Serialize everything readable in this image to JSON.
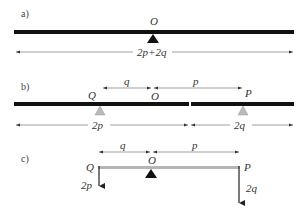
{
  "panels": {
    "a": {
      "label": "a)",
      "pivot_label": "O",
      "length_label": "2p+2q"
    },
    "b": {
      "label": "b)",
      "top_left_label": "q",
      "top_right_label": "p",
      "left_point_label": "Q",
      "pivot_label": "O",
      "right_point_label": "P",
      "bottom_left_label": "2p",
      "bottom_right_label": "2q"
    },
    "c": {
      "label": "c)",
      "top_left_label": "q",
      "top_right_label": "p",
      "left_point_label": "Q",
      "pivot_label": "O",
      "right_point_label": "P",
      "left_force_label": "2p",
      "right_force_label": "2q"
    }
  },
  "colors": {
    "bar": "#111111",
    "gray_bar": "#b5b5b5",
    "support_gray": "#b8b8b8",
    "dimension_line": "#777777"
  }
}
